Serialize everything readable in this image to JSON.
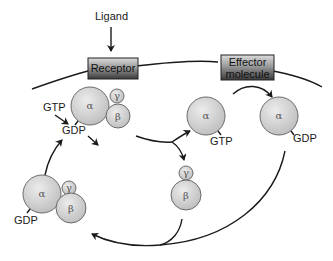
{
  "diagram": {
    "type": "G-protein activation cycle",
    "labels": {
      "ligand": "Ligand",
      "receptor": "Receptor",
      "effector_line1": "Effector",
      "effector_line2": "molecule",
      "gtp_in": "GTP",
      "gdp_top": "GDP",
      "gtp_alpha": "GTP",
      "gdp_alpha_effector": "GDP",
      "gdp_resting": "GDP"
    },
    "subunits": {
      "alpha": "α",
      "beta": "β",
      "gamma": "γ"
    },
    "colors": {
      "sphere_fill_light": "#e6e6e6",
      "sphere_fill_dark": "#bdbdbd",
      "sphere_stroke": "#6a6a6a",
      "box_top": "#d8d8d8",
      "box_bottom": "#3a3a3a",
      "line": "#1a1a1a"
    }
  }
}
